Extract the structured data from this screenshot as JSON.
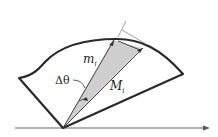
{
  "diagram": {
    "labels": {
      "m": "m",
      "m_sub": "i",
      "M": "M",
      "M_sub": "i",
      "delta_theta": "Δθ"
    },
    "colors": {
      "outline": "#2a2a2a",
      "wedge_fill": "#cfcfcf",
      "thin_line": "#888888",
      "axis": "#555555"
    }
  }
}
